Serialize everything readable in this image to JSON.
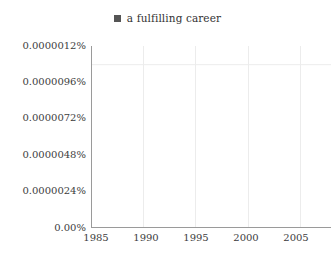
{
  "legend": {
    "marker_color": "#555555",
    "items": [
      {
        "label": "a fulfilling career",
        "color": "#7a7a7a"
      }
    ]
  },
  "axes": {
    "y_tick_labels": [
      "0.0000012%",
      "0.0000096%",
      "0.0000072%",
      "0.0000048%",
      "0.0000024%",
      "0.00%"
    ],
    "x_tick_labels": [
      "1985",
      "1990",
      "1995",
      "2000",
      "2005"
    ]
  },
  "colors": {
    "line": "#7a7a7a",
    "axis": "#9a9a9a",
    "grid": "#ececec",
    "text": "#3d3d3d",
    "background": "#ffffff"
  },
  "chart_data": {
    "type": "line",
    "title": "",
    "subtitle": "",
    "xlabel": "",
    "ylabel": "",
    "grid": true,
    "legend_position": "top-center",
    "xlim": [
      1985,
      2008
    ],
    "ylim": [
      0,
      1.3333e-06
    ],
    "x_ticks": [
      1985,
      1990,
      1995,
      2000,
      2005
    ],
    "y_ticks": [
      0,
      2.4e-06,
      4.8e-06,
      7.2e-06,
      9.6e-06,
      1.2e-06
    ],
    "y_tick_labels": [
      "0.00%",
      "0.0000024%",
      "0.0000048%",
      "0.0000072%",
      "0.0000096%",
      "0.0000012%"
    ],
    "y_unit": "percent",
    "series": [
      {
        "name": "a fulfilling career",
        "color": "#7a7a7a",
        "x": [
          1985,
          1986,
          1987,
          1988,
          1989,
          1990,
          1991,
          1992,
          1993,
          1994,
          1995,
          1996,
          1997,
          1998,
          1999,
          2000,
          2001,
          2002,
          2003,
          2004,
          2005,
          2006,
          2007,
          2008
        ],
        "values": [
          3.2e-06,
          3.7e-06,
          3.7e-06,
          4e-06,
          4.3e-06,
          4.6e-06,
          4.9e-06,
          5.3e-06,
          5.3e-06,
          5.9e-06,
          6.4e-06,
          7.1e-06,
          7.8e-06,
          8e-06,
          8.5e-06,
          9.2e-06,
          9.9e-06,
          1.07e-05,
          1.13e-05,
          1.15e-05,
          1.17e-05,
          1.2e-05,
          1.22e-05,
          1.22e-05
        ]
      }
    ]
  }
}
